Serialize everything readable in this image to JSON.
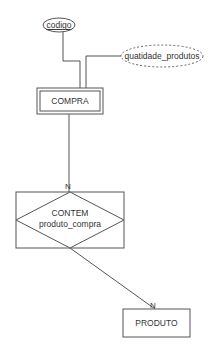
{
  "diagram": {
    "type": "entity-relationship",
    "entities": [
      {
        "id": "compra",
        "label": "COMPRA",
        "weak": true
      },
      {
        "id": "produto",
        "label": "PRODUTO",
        "weak": false
      }
    ],
    "attributes": [
      {
        "id": "codigo",
        "label": "codigo",
        "entity": "compra",
        "key": true,
        "derived": false
      },
      {
        "id": "quatidade_produtos",
        "label": "quatidade_produtos",
        "entity": "compra",
        "key": false,
        "derived": true
      }
    ],
    "relationships": [
      {
        "id": "contem",
        "label_line1": "CONTEM",
        "label_line2": "produto_compra",
        "aggregated": true,
        "links": [
          {
            "entity": "compra",
            "cardinality": "N"
          },
          {
            "entity": "produto",
            "cardinality": "N"
          }
        ]
      }
    ],
    "colors": {
      "stroke": "#555555",
      "text": "#333333",
      "background": "#ffffff"
    }
  }
}
